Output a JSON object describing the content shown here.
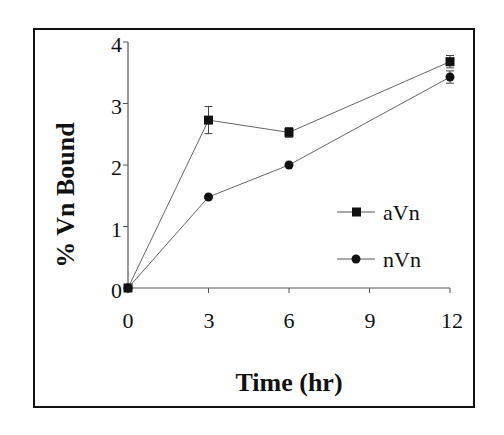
{
  "chart_data": {
    "type": "line",
    "title": "",
    "xlabel": "Time (hr)",
    "ylabel": "% Vn Bound",
    "x": [
      0,
      3,
      6,
      12
    ],
    "xticks": [
      "0",
      "3",
      "6",
      "9",
      "12"
    ],
    "yticks": [
      "0",
      "1",
      "2",
      "3",
      "4"
    ],
    "xlim": [
      0,
      12
    ],
    "ylim": [
      0,
      4
    ],
    "grid": false,
    "legend_position": "right-middle inside plot",
    "series": [
      {
        "name": "aVn",
        "marker": "square",
        "values": [
          0,
          2.73,
          2.53,
          3.68
        ],
        "error": [
          0,
          0.22,
          0.08,
          0.1
        ]
      },
      {
        "name": "nVn",
        "marker": "circle",
        "values": [
          0,
          1.48,
          2.0,
          3.43
        ],
        "error": [
          0,
          0.03,
          0.03,
          0.1
        ]
      }
    ]
  }
}
